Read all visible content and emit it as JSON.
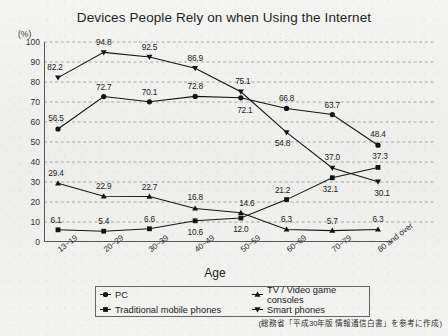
{
  "title": "Devices People Rely on when Using the Internet",
  "unit_label": "(%)",
  "xlabel": "Age",
  "credit": "(総務省「平成30年版 情報通信白書」を参考に作成)",
  "legend": {
    "items": [
      {
        "label": "PC",
        "marker": "circle-marker-icon",
        "color": "#1a1a1a"
      },
      {
        "label": "TV / Video game consoles",
        "marker": "triangle-marker-icon",
        "color": "#1a1a1a"
      },
      {
        "label": "Traditional mobile phones",
        "marker": "square-marker-icon",
        "color": "#1a1a1a"
      },
      {
        "label": "Smart phones",
        "marker": "inverted-triangle-marker-icon",
        "color": "#1a1a1a"
      }
    ]
  },
  "chart_data": {
    "type": "line",
    "title": "Devices People Rely on when Using the Internet",
    "xlabel": "Age",
    "ylabel": "(%)",
    "ylim": [
      0,
      100
    ],
    "ytick_step": 10,
    "yticks": [
      0,
      10,
      20,
      30,
      40,
      50,
      60,
      70,
      80,
      90,
      100
    ],
    "grid": true,
    "legend_position": "bottom",
    "categories": [
      "13~19",
      "20~29",
      "30~39",
      "40~49",
      "50~59",
      "60~69",
      "70~79",
      "80 and over"
    ],
    "series": [
      {
        "name": "PC",
        "marker": "circle",
        "values": [
          56.5,
          72.7,
          70.1,
          72.8,
          72.1,
          66.8,
          63.7,
          48.4
        ]
      },
      {
        "name": "TV / Video game consoles",
        "marker": "triangle",
        "values": [
          29.4,
          22.9,
          22.7,
          16.8,
          14.6,
          6.3,
          5.7,
          6.3
        ]
      },
      {
        "name": "Traditional mobile phones",
        "marker": "square",
        "values": [
          6.1,
          5.4,
          6.6,
          10.6,
          12.0,
          21.2,
          32.1,
          37.3
        ]
      },
      {
        "name": "Smart phones",
        "marker": "inverted-triangle",
        "values": [
          82.2,
          94.8,
          92.5,
          86.9,
          75.1,
          54.8,
          37.0,
          30.1
        ]
      }
    ]
  }
}
